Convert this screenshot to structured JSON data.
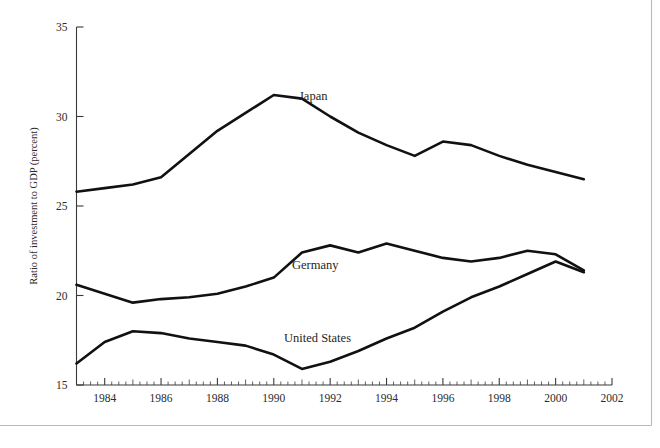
{
  "chart_data": {
    "type": "line",
    "title": "",
    "subtitle": "",
    "xlabel": "",
    "ylabel": "Ratio of investment to GDP (percent)",
    "xlim": [
      1983,
      2002
    ],
    "ylim": [
      15,
      35
    ],
    "grid": false,
    "legend_position": "inline-labels",
    "x_tick_labels": [
      "1984",
      "1986",
      "1988",
      "1990",
      "1992",
      "1994",
      "1996",
      "1998",
      "2000",
      "2002"
    ],
    "x_tick_values": [
      1984,
      1986,
      1988,
      1990,
      1992,
      1994,
      1996,
      1998,
      2000,
      2002
    ],
    "x_minor_tick_step": 0.25,
    "y_tick_labels": [
      "15",
      "20",
      "25",
      "30",
      "35"
    ],
    "y_tick_values": [
      15,
      20,
      25,
      30,
      35
    ],
    "x": [
      1983,
      1984,
      1985,
      1986,
      1987,
      1988,
      1989,
      1990,
      1991,
      1992,
      1993,
      1994,
      1995,
      1996,
      1997,
      1998,
      1999,
      2000,
      2001
    ],
    "series": [
      {
        "name": "Japan",
        "label": "Japan",
        "color": "#111111",
        "values": [
          25.8,
          26.0,
          26.2,
          26.6,
          27.9,
          29.2,
          30.2,
          31.2,
          31.0,
          30.0,
          29.1,
          28.4,
          27.8,
          28.6,
          28.4,
          27.8,
          27.3,
          26.9,
          26.5
        ]
      },
      {
        "name": "Germany",
        "label": "Germany",
        "color": "#111111",
        "values": [
          20.6,
          20.1,
          19.6,
          19.8,
          19.9,
          20.1,
          20.5,
          21.0,
          22.4,
          22.8,
          22.4,
          22.9,
          22.5,
          22.1,
          21.9,
          22.1,
          22.5,
          22.3,
          21.4
        ]
      },
      {
        "name": "United States",
        "label": "United States",
        "color": "#111111",
        "values": [
          16.2,
          17.4,
          18.0,
          17.9,
          17.6,
          17.4,
          17.2,
          16.7,
          15.9,
          16.3,
          16.9,
          17.6,
          18.2,
          19.1,
          19.9,
          20.5,
          21.2,
          21.9,
          21.3
        ]
      }
    ]
  },
  "figure": {
    "frame": "bottom-right-rule"
  }
}
